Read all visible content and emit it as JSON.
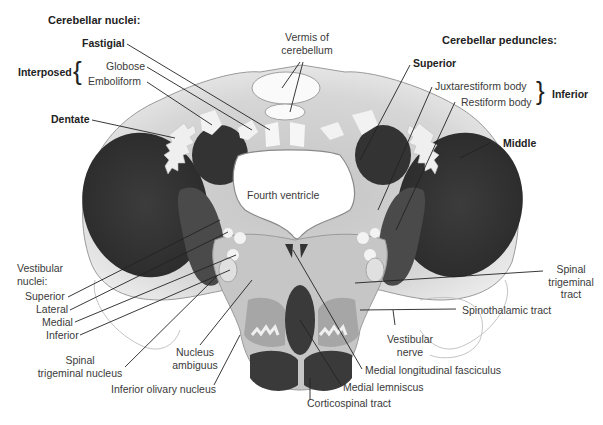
{
  "headings": {
    "cerebellar_nuclei": "Cerebellar nuclei:",
    "cerebellar_peduncles": "Cerebellar peduncles:"
  },
  "labels": {
    "fastigial": "Fastigial",
    "interposed": "Interposed",
    "globose": "Globose",
    "emboliform": "Emboliform",
    "dentate": "Dentate",
    "vermis_line1": "Vermis of",
    "vermis_line2": "cerebellum",
    "superior_peduncle": "Superior",
    "juxtarestiform": "Juxtarestiform body",
    "restiform": "Restiform body",
    "inferior_peduncle": "Inferior",
    "middle_peduncle": "Middle",
    "fourth_ventricle": "Fourth ventricle",
    "vestibular_nuclei_line1": "Vestibular",
    "vestibular_nuclei_line2": "nuclei:",
    "vn_superior": "Superior",
    "vn_lateral": "Lateral",
    "vn_medial": "Medial",
    "vn_inferior": "Inferior",
    "spinal_trig_nucleus_line1": "Spinal",
    "spinal_trig_nucleus_line2": "trigeminal nucleus",
    "nucleus_ambiguus_line1": "Nucleus",
    "nucleus_ambiguus_line2": "ambiguus",
    "inferior_olivary": "Inferior olivary nucleus",
    "spinal_trig_tract_line1": "Spinal",
    "spinal_trig_tract_line2": "trigeminal",
    "spinal_trig_tract_line3": "tract",
    "spinothalamic": "Spinothalamic tract",
    "vestibular_nerve_line1": "Vestibular",
    "vestibular_nerve_line2": "nerve",
    "mlf": "Medial longitudinal fasciculus",
    "medial_lemniscus": "Medial lemniscus",
    "corticospinal": "Corticospinal tract"
  },
  "braces": {
    "interposed": "{",
    "inferior": "}"
  },
  "colors": {
    "background": "#ffffff",
    "tissue_light": "#d9d9d9",
    "tissue_mid": "#b8b8b8",
    "tract_dark": "#3a3a3a",
    "nucleus_white": "#f4f4f4",
    "outline": "#8a8a8a",
    "leader": "#222222"
  }
}
